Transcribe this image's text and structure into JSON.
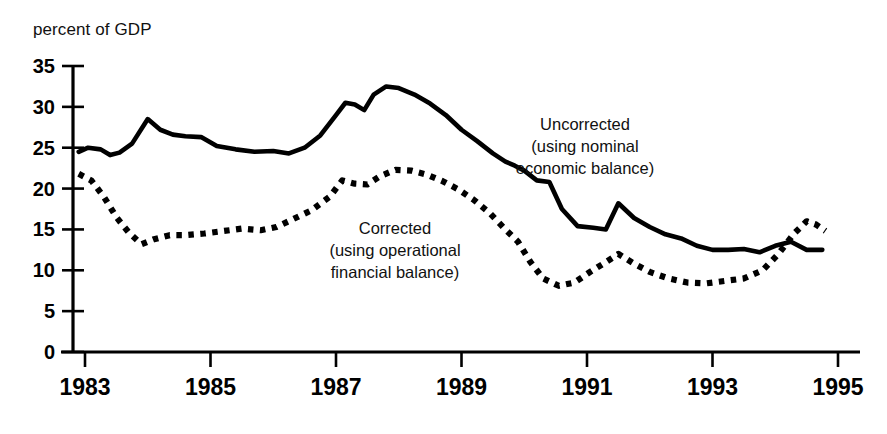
{
  "axis_unit_label": "percent of GDP",
  "annotations": {
    "uncorrected": "Uncorrected\n(using nominal\neconomic balance)",
    "corrected": "Corrected\n(using operational\nfinancial balance)"
  },
  "colors": {
    "ink": "#000000",
    "background": "#ffffff"
  },
  "chart_data": {
    "type": "line",
    "title": "",
    "subtitle": "",
    "xlabel": "",
    "ylabel": "percent of GDP",
    "xlim": [
      1982.9,
      1995.0
    ],
    "ylim": [
      0,
      35
    ],
    "yticks": [
      0,
      5,
      10,
      15,
      20,
      25,
      30,
      35
    ],
    "ytick_labels": [
      "0",
      "5",
      "10",
      "15",
      "20",
      "25",
      "30",
      "35"
    ],
    "xticks": [
      1983,
      1985,
      1987,
      1989,
      1991,
      1993,
      1995
    ],
    "xtick_labels": [
      "1983",
      "1985",
      "1987",
      "1989",
      "1991",
      "1993",
      "1995"
    ],
    "grid": false,
    "legend_position": "inline-annotation",
    "series": [
      {
        "name": "Uncorrected (using nominal economic balance)",
        "style": "solid",
        "color": "#000000",
        "x": [
          1982.9,
          1983.05,
          1983.25,
          1983.4,
          1983.55,
          1983.75,
          1984.0,
          1984.2,
          1984.4,
          1984.6,
          1984.85,
          1985.1,
          1985.4,
          1985.7,
          1986.0,
          1986.25,
          1986.5,
          1986.75,
          1987.0,
          1987.15,
          1987.3,
          1987.45,
          1987.6,
          1987.8,
          1988.0,
          1988.25,
          1988.5,
          1988.75,
          1989.0,
          1989.25,
          1989.5,
          1989.7,
          1989.85,
          1990.0,
          1990.2,
          1990.4,
          1990.6,
          1990.85,
          1991.1,
          1991.3,
          1991.5,
          1991.75,
          1992.0,
          1992.25,
          1992.5,
          1992.75,
          1993.0,
          1993.25,
          1993.5,
          1993.75,
          1994.0,
          1994.25,
          1994.5,
          1994.75
        ],
        "y": [
          24.5,
          25.0,
          24.8,
          24.1,
          24.4,
          25.5,
          28.5,
          27.2,
          26.6,
          26.4,
          26.3,
          25.2,
          24.8,
          24.5,
          24.6,
          24.3,
          25.0,
          26.5,
          29.0,
          30.5,
          30.3,
          29.6,
          31.5,
          32.5,
          32.3,
          31.5,
          30.4,
          29.0,
          27.2,
          25.8,
          24.3,
          23.3,
          22.8,
          22.2,
          21.0,
          20.8,
          17.5,
          15.4,
          15.2,
          15.0,
          18.2,
          16.4,
          15.3,
          14.4,
          13.9,
          13.0,
          12.5,
          12.5,
          12.6,
          12.2,
          13.0,
          13.5,
          12.5,
          12.5
        ]
      },
      {
        "name": "Corrected (using operational financial balance)",
        "style": "dotted",
        "color": "#000000",
        "x": [
          1982.9,
          1983.1,
          1983.3,
          1983.5,
          1983.7,
          1983.9,
          1984.1,
          1984.35,
          1984.6,
          1984.9,
          1985.2,
          1985.5,
          1985.8,
          1986.05,
          1986.3,
          1986.6,
          1986.9,
          1987.1,
          1987.3,
          1987.5,
          1987.7,
          1987.95,
          1988.2,
          1988.45,
          1988.7,
          1988.95,
          1989.2,
          1989.45,
          1989.7,
          1989.9,
          1990.1,
          1990.3,
          1990.55,
          1990.8,
          1991.05,
          1991.3,
          1991.5,
          1991.75,
          1992.0,
          1992.3,
          1992.6,
          1992.9,
          1993.2,
          1993.5,
          1993.8,
          1994.05,
          1994.3,
          1994.5,
          1994.65,
          1994.8
        ],
        "y": [
          21.8,
          21.0,
          19.0,
          16.5,
          14.6,
          13.2,
          13.8,
          14.3,
          14.3,
          14.5,
          14.8,
          15.1,
          14.9,
          15.3,
          16.2,
          17.3,
          19.0,
          21.0,
          20.6,
          20.5,
          21.5,
          22.3,
          22.2,
          21.7,
          20.9,
          19.9,
          18.6,
          17.0,
          15.0,
          13.5,
          11.0,
          9.0,
          8.1,
          8.5,
          9.8,
          11.0,
          12.0,
          10.8,
          9.8,
          9.0,
          8.5,
          8.4,
          8.7,
          9.0,
          10.0,
          12.0,
          14.5,
          16.0,
          15.6,
          14.8
        ]
      }
    ]
  }
}
